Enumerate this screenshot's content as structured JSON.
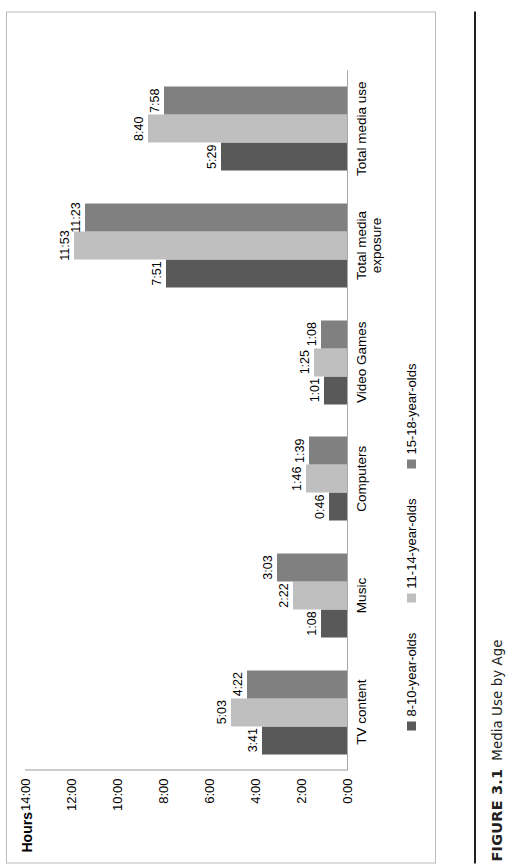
{
  "figure": {
    "number": "FIGURE 3.1",
    "caption": "Media Use by Age"
  },
  "colors": {
    "series_8_10": "#595959",
    "series_11_14": "#bfbfbf",
    "series_15_18": "#808080",
    "axis": "#9a9c9e",
    "frame": "#b9bbbd",
    "text": "#000000"
  },
  "chart_data": {
    "type": "bar",
    "title": "",
    "xlabel": "",
    "ylabel": "Hours",
    "ylim": [
      0,
      14
    ],
    "ytick_labels": [
      "14:00",
      "12:00",
      "10:00",
      "8:00",
      "6:00",
      "4:00",
      "2:00",
      "0:00"
    ],
    "ytick_values": [
      14,
      12,
      10,
      8,
      6,
      4,
      2,
      0
    ],
    "grid": false,
    "legend_position": "bottom-left",
    "orientation": "vertical-bars",
    "categories": [
      "TV content",
      "Music",
      "Computers",
      "Video Games",
      "Total media exposure",
      "Total media use"
    ],
    "series": [
      {
        "name": "8-10-year-olds",
        "color": "#595959",
        "labels": [
          "3:41",
          "1:08",
          "0:46",
          "1:01",
          "7:51",
          "5:29"
        ],
        "values": [
          3.683,
          1.133,
          0.767,
          1.017,
          7.85,
          5.483
        ]
      },
      {
        "name": "11-14-year-olds",
        "color": "#bfbfbf",
        "labels": [
          "5:03",
          "2:22",
          "1:46",
          "1:25",
          "11:53",
          "8:40"
        ],
        "values": [
          5.05,
          2.367,
          1.767,
          1.417,
          11.883,
          8.667
        ]
      },
      {
        "name": "15-18-year-olds",
        "color": "#808080",
        "labels": [
          "4:22",
          "3:03",
          "1:39",
          "1:08",
          "11:23",
          "7:58"
        ],
        "values": [
          4.367,
          3.05,
          1.65,
          1.133,
          11.383,
          7.967
        ]
      }
    ]
  }
}
